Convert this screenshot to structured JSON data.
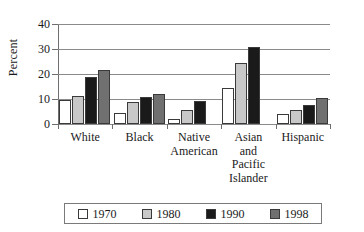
{
  "chart_data": {
    "type": "bar",
    "title": "",
    "xlabel": "",
    "ylabel": "Percent",
    "ylim": [
      0,
      40
    ],
    "yticks": [
      0,
      10,
      20,
      30,
      40
    ],
    "ytick_labels": [
      "0",
      "10",
      "20",
      "30",
      "40"
    ],
    "grid": true,
    "legend_position": "bottom",
    "categories": [
      "White",
      "Black",
      "Native American",
      "Asian and Pacific Islander",
      "Hispanic"
    ],
    "category_lines": [
      [
        "White"
      ],
      [
        "Black"
      ],
      [
        "Native",
        "American"
      ],
      [
        "Asian",
        "and",
        "Pacific",
        "Islander"
      ],
      [
        "Hispanic"
      ]
    ],
    "series": [
      {
        "name": "1970",
        "color": "#ffffff",
        "values": [
          9.6,
          4.6,
          2.2,
          14.4,
          4.2
        ]
      },
      {
        "name": "1980",
        "color": "#c8c8c8",
        "values": [
          11.3,
          8.7,
          5.8,
          24.6,
          5.7
        ]
      },
      {
        "name": "1990",
        "color": "#1a1a1a",
        "values": [
          19.0,
          11.0,
          9.3,
          30.9,
          7.8
        ]
      },
      {
        "name": "1998",
        "color": "#707070",
        "values": [
          21.5,
          12.1,
          null,
          null,
          10.3
        ]
      }
    ]
  },
  "legend": {
    "items": [
      {
        "label": "1970",
        "color": "#ffffff"
      },
      {
        "label": "1980",
        "color": "#c8c8c8"
      },
      {
        "label": "1990",
        "color": "#1a1a1a"
      },
      {
        "label": "1998",
        "color": "#707070"
      }
    ]
  }
}
